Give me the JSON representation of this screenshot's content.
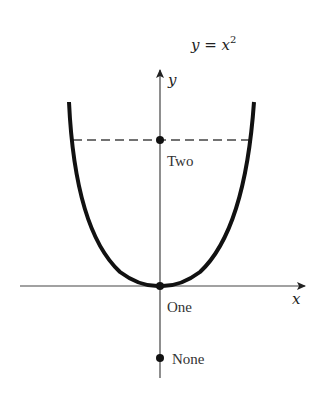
{
  "title": {
    "lhs": "y",
    "eq": " = ",
    "base": "x",
    "exp": "2"
  },
  "axes": {
    "x_label": "x",
    "y_label": "y"
  },
  "points": [
    {
      "label": "Two",
      "position": "on y-axis at dashed line crossing parabola"
    },
    {
      "label": "One",
      "position": "origin / parabola vertex"
    },
    {
      "label": "None",
      "position": "on negative y-axis"
    }
  ],
  "colors": {
    "curve": "#111111",
    "axis": "#444444",
    "dashed": "#444444"
  }
}
